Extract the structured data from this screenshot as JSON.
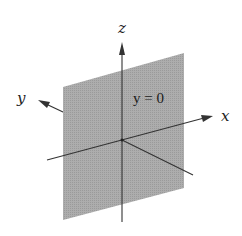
{
  "figure": {
    "plane_label": "y = 0",
    "axes": {
      "x_label": "x",
      "y_label": "y",
      "z_label": "z"
    },
    "colors": {
      "plane_fill": "#a9a9a9",
      "axis_stroke": "#333333",
      "background": "#ffffff"
    }
  }
}
